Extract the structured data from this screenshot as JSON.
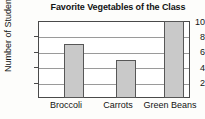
{
  "chart_data": {
    "type": "bar",
    "title": "Favorite Vegetables of the Class",
    "xlabel": "",
    "ylabel": "Number of Students",
    "categories": [
      "Broccoli",
      "Carrots",
      "Green Beans"
    ],
    "values": [
      7,
      5,
      10
    ],
    "ylim": [
      0,
      10
    ],
    "yticks": [
      "2",
      "4",
      "6",
      "8",
      "10"
    ],
    "grid": true,
    "legend": false,
    "bar_color": "#c9c9c9",
    "bar_edge_color": "#575757",
    "axis_color": "#4a4a4a",
    "grid_color": "#9a9a9a",
    "text_color": "#131313"
  }
}
